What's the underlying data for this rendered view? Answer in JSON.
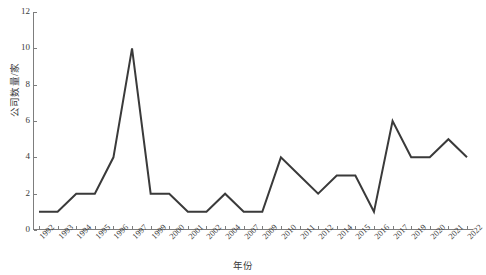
{
  "chart_data": {
    "type": "line",
    "title": "",
    "xlabel": "年份",
    "ylabel": "公司数量/家",
    "categories": [
      "1992",
      "1993",
      "1994",
      "1995",
      "1996",
      "1997",
      "1999",
      "2000",
      "2001",
      "2002",
      "2004",
      "2007",
      "2009",
      "2010",
      "2011",
      "2012",
      "2014",
      "2015",
      "2016",
      "2017",
      "2019",
      "2020",
      "2021",
      "2022"
    ],
    "values": [
      1,
      1,
      2,
      2,
      4,
      10,
      2,
      2,
      1,
      1,
      2,
      1,
      1,
      4,
      3,
      2,
      3,
      3,
      1,
      6,
      4,
      4,
      5,
      4
    ],
    "series": [
      {
        "name": "公司数量",
        "values": [
          1,
          1,
          2,
          2,
          4,
          10,
          2,
          2,
          1,
          1,
          2,
          1,
          1,
          4,
          3,
          2,
          3,
          3,
          1,
          6,
          4,
          4,
          5,
          4
        ]
      }
    ],
    "ylim": [
      0,
      12
    ],
    "yticks": [
      0,
      2,
      4,
      6,
      8,
      10,
      12
    ],
    "ytick_labels": [
      "0",
      "2",
      "4",
      "6",
      "8",
      "10",
      "12"
    ],
    "grid": false,
    "legend": false,
    "legend_position": "none",
    "line_color": "#3a3a3a",
    "axis_color": "#7d7d7d",
    "background_color": "#ffffff",
    "marker": "none"
  }
}
